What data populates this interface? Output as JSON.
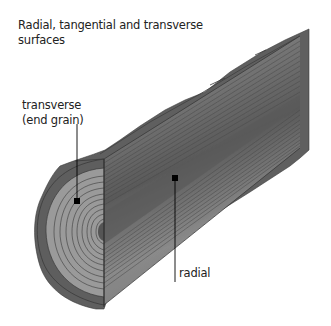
{
  "diagram": {
    "title": "Radial, tangential and transverse surfaces",
    "labels": {
      "transverse_line1": "transverse",
      "transverse_line2": "(end grain)",
      "radial": "radial"
    },
    "colors": {
      "bark": "#5f5f5f",
      "bark_dark": "#4a4a4a",
      "sapwood": "#8e8e8e",
      "heartwood": "#6e6e6e",
      "ring_line": "#3a3a3a",
      "marker": "#000000",
      "text": "#222222"
    }
  }
}
